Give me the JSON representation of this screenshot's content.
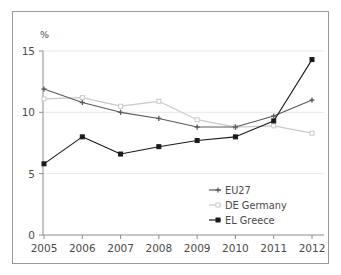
{
  "chart_data": {
    "type": "line",
    "title": "",
    "subtitle": "",
    "xlabel": "",
    "ylabel": "%",
    "ylabel_position": "top-left",
    "categories": [
      "2005",
      "2006",
      "2007",
      "2008",
      "2009",
      "2010",
      "2011",
      "2012"
    ],
    "x": [
      2005,
      2006,
      2007,
      2008,
      2009,
      2010,
      2011,
      2012
    ],
    "xlim": [
      2005,
      2012
    ],
    "ylim": [
      0,
      15
    ],
    "yticks": [
      "0",
      "5",
      "10",
      "15"
    ],
    "ytick_values": [
      0,
      5,
      10,
      15
    ],
    "grid": "horizontal",
    "legend_position": "bottom-right",
    "series": [
      {
        "name": "EU27",
        "color": "#5a5a5a",
        "marker": "plus",
        "values": [
          11.9,
          10.8,
          10.0,
          9.5,
          8.8,
          8.8,
          9.7,
          11.0
        ]
      },
      {
        "name": "DE Germany",
        "color": "#c9c9c9",
        "marker": "square",
        "values": [
          11.1,
          11.2,
          10.5,
          10.9,
          9.4,
          8.8,
          8.9,
          8.3
        ]
      },
      {
        "name": "EL Greece",
        "color": "#1a1a1a",
        "marker": "square-filled",
        "values": [
          5.8,
          8.0,
          6.6,
          7.2,
          7.7,
          8.0,
          9.3,
          14.3
        ]
      }
    ]
  },
  "axis": {
    "y_unit_label": "%"
  },
  "legend": {
    "items": [
      {
        "label": "EU27"
      },
      {
        "label": "DE Germany"
      },
      {
        "label": "EL Greece"
      }
    ]
  },
  "colors": {
    "frame_border": "#9a9a9a",
    "background": "#ffffff",
    "gridline": "#e8e8e8",
    "axis": "#8c8c8c",
    "text": "#4a4a4a"
  }
}
